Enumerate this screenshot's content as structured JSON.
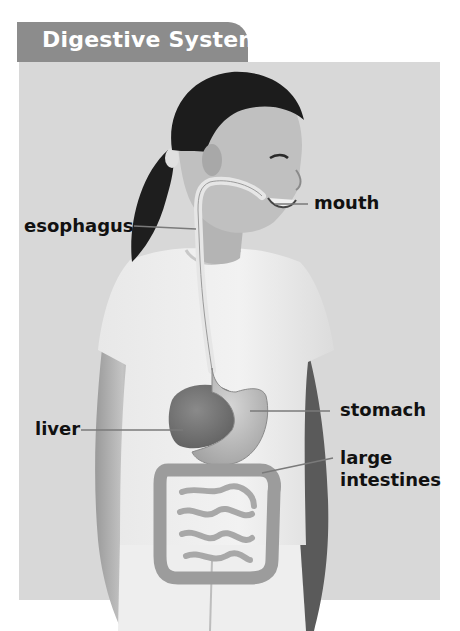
{
  "title": "Digestive System",
  "labels": {
    "mouth": "mouth",
    "esophagus": "esophagus",
    "liver": "liver",
    "stomach": "stomach",
    "large_intestines_line1": "large",
    "large_intestines_line2": "intestines"
  },
  "colors": {
    "page_background": "#ffffff",
    "panel_background": "#d8d8d8",
    "title_tab": "#8c8c8c",
    "title_text": "#ffffff",
    "label_text": "#111111",
    "leader_line": "#7a7a7a"
  }
}
